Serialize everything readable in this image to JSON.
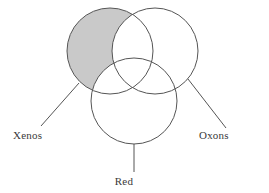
{
  "figure": {
    "type": "venn-diagram",
    "background_color": "#ffffff",
    "stroke_color": "#555555",
    "shaded_fill_color": "#c9c9c9",
    "unshaded_fill_color": "#ffffff",
    "label_color": "#3a3a3a"
  },
  "sets": [
    {
      "id": "xenos",
      "label": "Xenos",
      "position": "upper-left",
      "shaded": true,
      "circle": {
        "cx": 110,
        "cy": 51,
        "r": 43
      },
      "label_point": {
        "x": 13,
        "y": 139
      },
      "leader_line": {
        "x1": 79,
        "y1": 83,
        "x2": 41,
        "y2": 126
      }
    },
    {
      "id": "oxons",
      "label": "Oxons",
      "position": "upper-right",
      "shaded": false,
      "circle": {
        "cx": 155,
        "cy": 51,
        "r": 43
      },
      "label_point": {
        "x": 199,
        "y": 139
      },
      "leader_line": {
        "x1": 188,
        "y1": 79,
        "x2": 226,
        "y2": 128
      }
    },
    {
      "id": "red",
      "label": "Red",
      "position": "bottom",
      "shaded": false,
      "circle": {
        "cx": 134,
        "cy": 101,
        "r": 43
      },
      "label_point": {
        "x": 124,
        "y": 185
      },
      "leader_line": {
        "x1": 134,
        "y1": 144,
        "x2": 134,
        "y2": 172
      }
    }
  ],
  "shading": {
    "description": "Only the region of the Xenos circle that lies outside both the Oxons and Red circles is filled gray.",
    "shaded_region": "xenos-only",
    "shaded_set_id": "xenos"
  }
}
